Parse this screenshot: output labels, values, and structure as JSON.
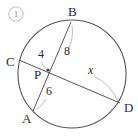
{
  "figure": {
    "problem_number": "1",
    "problem_number_display": "①",
    "type": "circle-intersecting-chords",
    "background_color": "#ffffff",
    "stroke_color": "#555555",
    "leader_color": "#a8a8a8",
    "text_color": "#2b2b2b",
    "index_color": "#8e8e8e",
    "circle": {
      "cx": 72,
      "cy": 74,
      "r": 54
    },
    "points": [
      {
        "name": "A",
        "label": "A",
        "x": 33,
        "y": 111,
        "label_x": 22,
        "label_y": 123
      },
      {
        "name": "B",
        "label": "B",
        "x": 71,
        "y": 22,
        "label_x": 68,
        "label_y": 16
      },
      {
        "name": "C",
        "label": "C",
        "x": 19,
        "y": 60,
        "label_x": 6,
        "label_y": 66
      },
      {
        "name": "D",
        "label": "D",
        "x": 120,
        "y": 103,
        "label_x": 124,
        "label_y": 112
      },
      {
        "name": "P",
        "label": "P",
        "x": 48,
        "y": 70,
        "label_x": 34,
        "label_y": 79
      }
    ],
    "chords": [
      {
        "name": "chord-AB",
        "from": "A",
        "to": "B"
      },
      {
        "name": "chord-CD",
        "from": "C",
        "to": "D"
      }
    ],
    "segments": [
      {
        "name": "segment-PC",
        "label": "4",
        "italic": false,
        "label_x": 38,
        "label_y": 58
      },
      {
        "name": "segment-PB",
        "label": "8",
        "italic": false,
        "label_x": 64,
        "label_y": 55
      },
      {
        "name": "segment-PA",
        "label": "6",
        "italic": false,
        "label_x": 46,
        "label_y": 95
      },
      {
        "name": "segment-PD",
        "label": "x",
        "italic": true,
        "label_x": 88,
        "label_y": 74
      }
    ],
    "leaders": [
      {
        "name": "leader-4",
        "path": "M 41 62 Q 44 67 47 70"
      },
      {
        "name": "leader-8",
        "path": "M 68 50 Q 74 38 72 26"
      },
      {
        "name": "leader-6",
        "path": "M 46 99 Q 42 106 36 110"
      },
      {
        "name": "leader-x",
        "path": "M 94 76 Q 110 84 118 101"
      }
    ]
  }
}
